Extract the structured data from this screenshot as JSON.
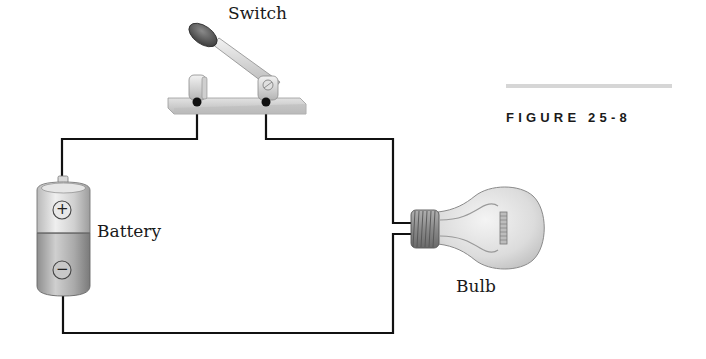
{
  "figure": {
    "title": "FIGURE 25-8",
    "rule_color": "#d6d6d6"
  },
  "labels": {
    "switch": "Switch",
    "battery": "Battery",
    "bulb": "Bulb"
  },
  "battery": {
    "positive_symbol": "+",
    "negative_symbol": "−"
  },
  "colors": {
    "wire": "#111111",
    "metal_light": "#e8e8e8",
    "metal_mid": "#bdbdbd",
    "metal_dark": "#8a8a8a",
    "handle_knob": "#5a5a5a"
  }
}
